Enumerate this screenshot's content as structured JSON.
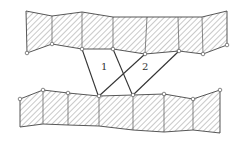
{
  "diagram": {
    "type": "linkage-between-hatched-blocks",
    "top_band": {
      "top_edge": [
        [
          26,
          11
        ],
        [
          52,
          16
        ],
        [
          82,
          12
        ],
        [
          113,
          17
        ],
        [
          147,
          17
        ],
        [
          178,
          17
        ],
        [
          202,
          17
        ],
        [
          227,
          11
        ]
      ],
      "bottom_edge": [
        [
          27,
          53
        ],
        [
          52,
          44
        ],
        [
          82,
          49
        ],
        [
          113,
          49
        ],
        [
          145,
          54
        ],
        [
          179,
          51
        ],
        [
          203,
          54
        ],
        [
          227,
          45
        ]
      ]
    },
    "bottom_band": {
      "top_edge": [
        [
          20,
          99
        ],
        [
          43,
          90
        ],
        [
          68,
          93
        ],
        [
          99,
          96
        ],
        [
          133,
          95
        ],
        [
          164,
          94
        ],
        [
          193,
          99
        ],
        [
          220,
          90
        ]
      ],
      "bottom_edge": [
        [
          20,
          127
        ],
        [
          43,
          124
        ],
        [
          68,
          125
        ],
        [
          99,
          126
        ],
        [
          133,
          130
        ],
        [
          164,
          132
        ],
        [
          193,
          130
        ],
        [
          220,
          133
        ]
      ]
    },
    "bars": [
      {
        "id": "bar-1a",
        "from": [
          82,
          49
        ],
        "to": [
          98,
          95
        ]
      },
      {
        "id": "bar-1b",
        "from": [
          113,
          49
        ],
        "to": [
          132,
          94
        ]
      },
      {
        "id": "bar-2a",
        "from": [
          145,
          54
        ],
        "to": [
          99,
          96
        ]
      },
      {
        "id": "bar-2b",
        "from": [
          179,
          51
        ],
        "to": [
          133,
          95
        ]
      }
    ],
    "labels": [
      {
        "text": "1",
        "x": 101,
        "y": 70
      },
      {
        "text": "2",
        "x": 142,
        "y": 70
      }
    ]
  }
}
